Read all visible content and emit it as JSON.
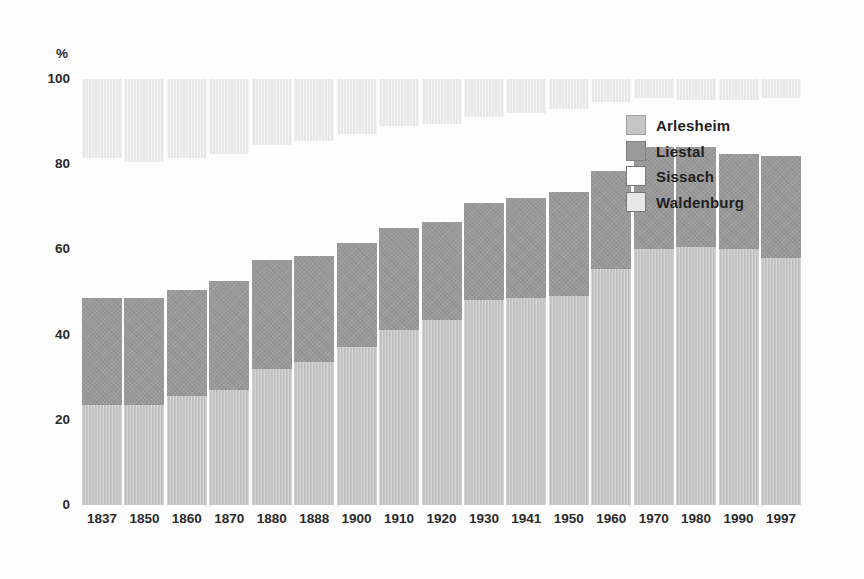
{
  "chart_data": {
    "type": "bar",
    "stacked": true,
    "orientation": "vertical",
    "title": "",
    "xlabel": "",
    "ylabel": "%",
    "ylim": [
      0,
      100
    ],
    "yticks": [
      0,
      20,
      40,
      60,
      80,
      100
    ],
    "grid": false,
    "legend_position": "upper-right-overlay",
    "axis_text_color": "#2b2b2b",
    "categories": [
      "1837",
      "1850",
      "1860",
      "1870",
      "1880",
      "1888",
      "1900",
      "1910",
      "1920",
      "1930",
      "1941",
      "1950",
      "1960",
      "1970",
      "1980",
      "1990",
      "1997"
    ],
    "series": [
      {
        "name": "Arlesheim",
        "color": "#c5c5c5",
        "border_color": "#9e9e9e",
        "texture": "fine",
        "values": [
          23.5,
          23.5,
          25.5,
          27,
          32,
          33.5,
          37,
          41,
          43.5,
          48,
          48.5,
          49,
          55.5,
          60,
          60.5,
          60,
          58
        ]
      },
      {
        "name": "Liestal",
        "color": "#9a9a9a",
        "border_color": "#828282",
        "texture": "cross",
        "values": [
          25,
          25,
          25,
          25.5,
          25.5,
          25,
          24.5,
          24,
          23,
          23,
          23.5,
          24.5,
          23,
          24,
          23.5,
          22.5,
          24
        ]
      },
      {
        "name": "Sissach",
        "color": "#fdfdfd",
        "border_color": "#777777",
        "texture": "none",
        "values": [
          33,
          32,
          31,
          30,
          27,
          27,
          25.5,
          24,
          23,
          20,
          20,
          19.5,
          16,
          11.5,
          11,
          12.5,
          13.5
        ]
      },
      {
        "name": "Waldenburg",
        "color": "#e7e7e7",
        "border_color": "#777777",
        "texture": "vert",
        "values": [
          18.5,
          19.5,
          18.5,
          17.5,
          15.5,
          14.5,
          13,
          11,
          10.5,
          9,
          8,
          7,
          5.5,
          4.5,
          5,
          5,
          4.5
        ]
      }
    ]
  }
}
